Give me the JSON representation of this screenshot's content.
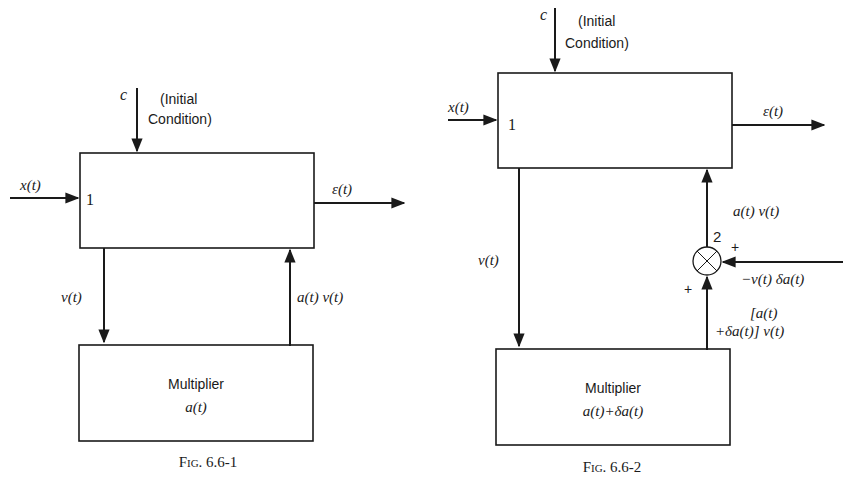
{
  "figures": [
    {
      "caption": "Fig. 6.6-1",
      "top_block": {
        "port_label": "1"
      },
      "initial_condition": {
        "symbol": "c",
        "label_line1": "(Initial",
        "label_line2": "Condition)"
      },
      "input_signal": "x(t)",
      "output_signal": "ε(t)",
      "down_signal": "v(t)",
      "up_signal": "a(t) v(t)",
      "multiplier_block": {
        "title": "Multiplier",
        "expression": "a(t)"
      }
    },
    {
      "caption": "Fig. 6.6-2",
      "top_block": {
        "port_label": "1"
      },
      "initial_condition": {
        "symbol": "c",
        "label_line1": "(Initial",
        "label_line2": "Condition)"
      },
      "input_signal": "x(t)",
      "output_signal": "ε(t)",
      "down_signal": "v(t)",
      "up_signal": "a(t) v(t)",
      "summing_junction": {
        "port_label": "2",
        "side_sign": "+",
        "bottom_sign": "+",
        "side_input": "−v(t) δa(t)"
      },
      "multiplier_output_line1": "[a(t)",
      "multiplier_output_line2": "+δa(t)] v(t)",
      "multiplier_block": {
        "title": "Multiplier",
        "expression": "a(t)+δa(t)"
      }
    }
  ]
}
